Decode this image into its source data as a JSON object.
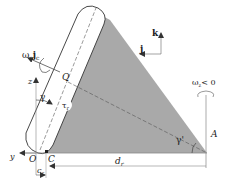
{
  "figure": {
    "labels": {
      "omega_c_j_c": "ω",
      "omega_c_sub": "c",
      "j_c_bold": "j",
      "j_c_sub": "c",
      "Q": "Q",
      "z": "z",
      "gamma": "γ",
      "tau_r": "τ",
      "tau_r_sub": "r",
      "y": "y",
      "O": "O",
      "C": "C",
      "c_r": "c",
      "c_r_sub": "r",
      "d_r": "d",
      "d_r_sub": "r",
      "gamma_prime": "γ'",
      "A": "A",
      "k": "k",
      "j": "j",
      "omega_z_cond": "ω",
      "omega_z_sub": "z",
      "omega_z_rel": "< 0"
    },
    "colors": {
      "shade": "#a9a9a9",
      "line": "#333333",
      "light_line": "#888888",
      "background": "#ffffff"
    }
  }
}
